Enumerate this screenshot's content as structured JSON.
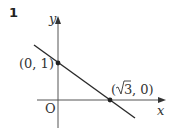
{
  "problem_number": "1",
  "axes": {
    "x_label": "x",
    "y_label": "y",
    "origin_label": "O"
  },
  "points": [
    {
      "label": "(0, 1)",
      "x": 0,
      "y": 1
    },
    {
      "label_prefix": "(",
      "label_sqrt": "3",
      "label_suffix": ", 0)",
      "x": 1.732,
      "y": 0
    }
  ],
  "line": {
    "description": "line through (0,1) and (√3,0)",
    "slope": -0.577,
    "intercept": 1
  },
  "colors": {
    "stroke": "#2a2a2a",
    "axis": "#555555",
    "text": "#333333"
  }
}
